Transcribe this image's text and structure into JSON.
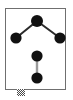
{
  "figure": {
    "frame": {
      "x": 5,
      "y": 8,
      "width": 61,
      "height": 82,
      "border_color": "#6f6f6f",
      "background_color": "#ffffff"
    },
    "node_color": "#111111",
    "edge_color": "#2b2b2b",
    "secondary_edge_color": "#9a9a9a"
  },
  "chart_data": {
    "type": "scatter",
    "subtitle": "",
    "xlabel": "",
    "ylabel": "",
    "xlim": [
      0,
      73
    ],
    "ylim": [
      0,
      100
    ],
    "grid": false,
    "legend_position": "none",
    "annotations": [],
    "nodes": [
      {
        "id": "n1",
        "label": "",
        "x": 37,
        "y": 21,
        "r": 6.0,
        "color": "#111111",
        "component": 1
      },
      {
        "id": "n2",
        "label": "",
        "x": 16,
        "y": 38,
        "r": 5.6,
        "color": "#111111",
        "component": 1
      },
      {
        "id": "n3",
        "label": "",
        "x": 60,
        "y": 38,
        "r": 5.6,
        "color": "#111111",
        "component": 1
      },
      {
        "id": "n4",
        "label": "",
        "x": 37,
        "y": 56,
        "r": 5.6,
        "color": "#111111",
        "component": 2
      },
      {
        "id": "n5",
        "label": "",
        "x": 37,
        "y": 78,
        "r": 5.6,
        "color": "#111111",
        "component": 2
      }
    ],
    "edges": [
      {
        "source": "n1",
        "target": "n2",
        "color": "#2b2b2b",
        "width": 2.0
      },
      {
        "source": "n1",
        "target": "n3",
        "color": "#2b2b2b",
        "width": 2.0
      },
      {
        "source": "n4",
        "target": "n5",
        "color": "#9a9a9a",
        "width": 2.4
      }
    ],
    "node_count": 5,
    "edge_count": 3,
    "component_count": 2
  },
  "handle": {
    "name": "resize-handle",
    "pattern": "checkerboard",
    "color": "#4a4a4a"
  }
}
